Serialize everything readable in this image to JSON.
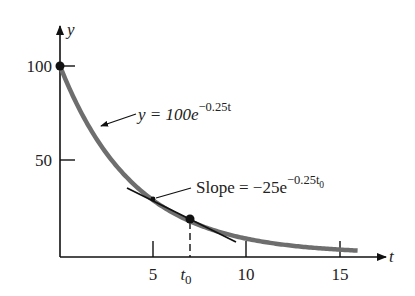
{
  "chart_data": {
    "type": "line",
    "title": "",
    "xlabel": "t",
    "ylabel": "y",
    "xlim": [
      0,
      17
    ],
    "ylim": [
      0,
      110
    ],
    "grid": false,
    "legend": null,
    "x_ticks": [
      {
        "value": 5,
        "label": "5"
      },
      {
        "value": 7,
        "label": "t",
        "subscript": "0",
        "dashed_guide": true
      },
      {
        "value": 10,
        "label": "10"
      },
      {
        "value": 15,
        "label": "15"
      }
    ],
    "y_ticks": [
      {
        "value": 50,
        "label": "50"
      },
      {
        "value": 100,
        "label": "100"
      }
    ],
    "series": [
      {
        "name": "y = 100e^(-0.25t)",
        "function": "100*exp(-0.25*t)",
        "color": "#6e6e6e",
        "x": [
          0,
          1,
          2,
          3,
          4,
          5,
          6,
          7,
          8,
          9,
          10,
          11,
          12,
          13,
          14,
          15,
          16
        ],
        "values": [
          100,
          77.9,
          60.7,
          47.2,
          36.8,
          28.7,
          22.3,
          17.4,
          13.5,
          10.5,
          8.2,
          6.4,
          5.0,
          3.9,
          3.0,
          2.4,
          1.8
        ]
      },
      {
        "name": "tangent line at t0",
        "color": "#111111",
        "x": [
          3.6,
          9.5
        ],
        "values": [
          35.5,
          6.6
        ]
      }
    ],
    "points": [
      {
        "name": "initial-point",
        "t": 0,
        "y": 100
      },
      {
        "name": "tangent-point",
        "t": 7,
        "y": 17.4
      }
    ],
    "annotations": [
      {
        "text_main": "y = 100e",
        "text_sup": "−0.25t",
        "points_to": "curve"
      },
      {
        "text_main": "Slope = −25e",
        "text_sup": "−0.25t",
        "text_sup_sub": "0",
        "points_to": "tangent line"
      }
    ]
  },
  "labels": {
    "y_axis": "y",
    "x_axis": "t",
    "y100": "100",
    "y50": "50",
    "x5": "5",
    "x10": "10",
    "x15": "15",
    "t0_main": "t",
    "t0_sub": "0",
    "curve_eq_main": "y = 100e",
    "curve_eq_sup": "−0.25t",
    "slope_main": "Slope = −25e",
    "slope_sup": "−0.25t",
    "slope_sup_sub": "0"
  }
}
